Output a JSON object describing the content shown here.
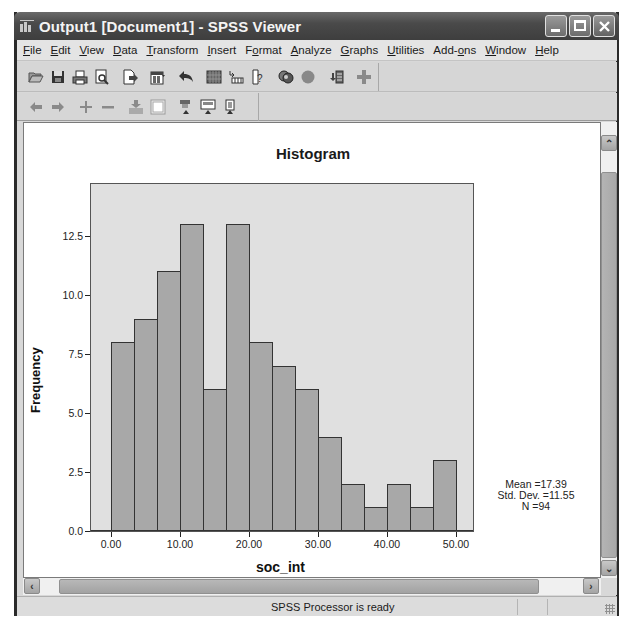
{
  "window": {
    "title": "Output1 [Document1] - SPSS Viewer",
    "controls": [
      "minimize",
      "maximize",
      "close"
    ]
  },
  "menubar": {
    "items": [
      {
        "label": "File",
        "mnemonic": "F"
      },
      {
        "label": "Edit",
        "mnemonic": "E"
      },
      {
        "label": "View",
        "mnemonic": "V"
      },
      {
        "label": "Data",
        "mnemonic": "D"
      },
      {
        "label": "Transform",
        "mnemonic": "T"
      },
      {
        "label": "Insert",
        "mnemonic": "I"
      },
      {
        "label": "Format",
        "mnemonic": "o"
      },
      {
        "label": "Analyze",
        "mnemonic": "A"
      },
      {
        "label": "Graphs",
        "mnemonic": "G"
      },
      {
        "label": "Utilities",
        "mnemonic": "U"
      },
      {
        "label": "Add-ons",
        "mnemonic": "o"
      },
      {
        "label": "Window",
        "mnemonic": "W"
      },
      {
        "label": "Help",
        "mnemonic": "H"
      }
    ]
  },
  "toolbar1": {
    "icons": [
      "open-icon",
      "save-icon",
      "print-icon",
      "print-preview-icon",
      "export-icon",
      "dialog-recall-icon",
      "undo-icon",
      "goto-data-icon",
      "variables-icon",
      "help-icon",
      "select-cases-icon",
      "value-labels-icon",
      "designate-window-icon",
      "add-icon"
    ]
  },
  "toolbar2": {
    "icons": [
      "promote-icon",
      "demote-icon",
      "expand-icon",
      "collapse-icon",
      "show-icon",
      "hide-icon",
      "insert-heading-icon",
      "insert-title-icon",
      "insert-text-icon"
    ]
  },
  "status": {
    "text": "SPSS Processor is ready"
  },
  "chart_data": {
    "type": "bar",
    "title": "Histogram",
    "xlabel": "soc_int",
    "ylabel": "Frequency",
    "x_tick_labels": [
      "0.00",
      "10.00",
      "20.00",
      "30.00",
      "40.00",
      "50.00"
    ],
    "y_tick_labels": [
      "0.0",
      "2.5",
      "5.0",
      "7.5",
      "10.0",
      "12.5"
    ],
    "ylim": [
      0,
      14.7
    ],
    "xlim": [
      -3,
      52
    ],
    "bin_width": 3.33,
    "bin_centers": [
      0.0,
      3.33,
      6.67,
      10.0,
      13.33,
      16.67,
      20.0,
      23.33,
      26.67,
      30.0,
      33.33,
      36.67,
      40.0,
      43.33,
      46.67
    ],
    "values": [
      8,
      9,
      11,
      13,
      6,
      13,
      8,
      7,
      6,
      4,
      2,
      1,
      2,
      1,
      3
    ],
    "grid": false,
    "legend": null,
    "annotations": {
      "mean": "Mean =17.39",
      "std": "Std. Dev. =11.55",
      "n": "N =94"
    },
    "colors": {
      "plot_bg": "#e0e0e0",
      "bar_fill": "#a8a8a8",
      "bar_edge": "#333333"
    }
  }
}
